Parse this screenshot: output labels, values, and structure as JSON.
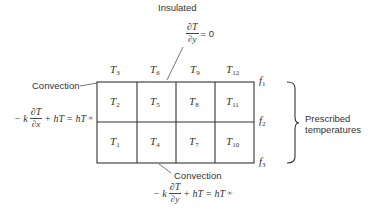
{
  "diagram": {
    "type": "finite-difference grid with boundary conditions",
    "top_boundary": {
      "label": "Insulated",
      "equation": {
        "numerator": "∂T",
        "denominator": "∂y",
        "rhs": "= 0"
      }
    },
    "left_boundary": {
      "label": "Convection",
      "equation": {
        "prefix": "− k",
        "numerator": "∂T",
        "denominator": "∂x",
        "suffix": "+ hT = hT",
        "sub": "∞"
      }
    },
    "bottom_boundary": {
      "label": "Convection",
      "equation": {
        "prefix": "− k",
        "numerator": "∂T",
        "denominator": "∂y",
        "suffix": "+ hT = hT",
        "sub": "∞"
      }
    },
    "right_boundary": {
      "label_line1": "Prescribed",
      "label_line2": "temperatures",
      "values": [
        {
          "base": "f",
          "sub": "1"
        },
        {
          "base": "f",
          "sub": "2"
        },
        {
          "base": "f",
          "sub": "3"
        }
      ]
    },
    "top_row_nodes": [
      {
        "base": "T",
        "sub": "3"
      },
      {
        "base": "T",
        "sub": "6"
      },
      {
        "base": "T",
        "sub": "9"
      },
      {
        "base": "T",
        "sub": "12"
      }
    ],
    "grid_rows": [
      [
        {
          "base": "T",
          "sub": "2"
        },
        {
          "base": "T",
          "sub": "5"
        },
        {
          "base": "T",
          "sub": "8"
        },
        {
          "base": "T",
          "sub": "11"
        }
      ],
      [
        {
          "base": "T",
          "sub": "1"
        },
        {
          "base": "T",
          "sub": "4"
        },
        {
          "base": "T",
          "sub": "7"
        },
        {
          "base": "T",
          "sub": "10"
        }
      ]
    ]
  }
}
